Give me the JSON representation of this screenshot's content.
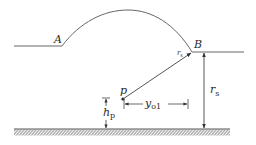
{
  "diagram": {
    "labels": {
      "A": "A",
      "B": "B",
      "P": "p",
      "rs_near_B": {
        "main": "r",
        "sub": "s"
      },
      "rs_vertical": {
        "main": "r",
        "sub": "s"
      },
      "yo1": {
        "main": "y",
        "sub": "o1"
      },
      "hp": {
        "main": "h",
        "sub": "p"
      }
    },
    "colors": {
      "line": "#555555",
      "text": "#2b2b2b",
      "background": "#ffffff"
    }
  }
}
